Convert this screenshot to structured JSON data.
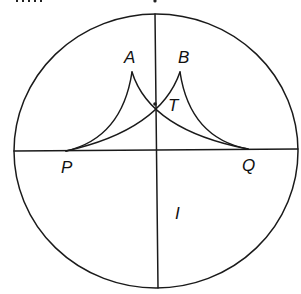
{
  "figure": {
    "labels": {
      "A": "A",
      "B": "B",
      "T": "T",
      "P": "P",
      "Q": "Q",
      "I": "I"
    },
    "colors": {
      "line": "#1a1a1a",
      "background": "#ffffff"
    }
  }
}
